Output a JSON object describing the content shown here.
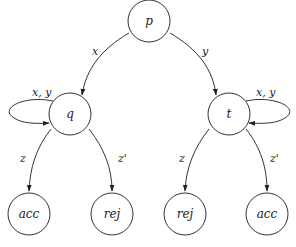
{
  "diagram": {
    "type": "state-transition",
    "nodes": {
      "p": {
        "label": "p"
      },
      "q": {
        "label": "q"
      },
      "t": {
        "label": "t"
      },
      "q_acc": {
        "label": "acc"
      },
      "q_rej": {
        "label": "rej"
      },
      "t_rej": {
        "label": "rej"
      },
      "t_acc": {
        "label": "acc"
      }
    },
    "edges": {
      "p_q": {
        "from": "p",
        "to": "q",
        "label": "x"
      },
      "p_t": {
        "from": "p",
        "to": "t",
        "label": "y"
      },
      "q_loop": {
        "from": "q",
        "to": "q",
        "label": "x, y"
      },
      "t_loop": {
        "from": "t",
        "to": "t",
        "label": "x, y"
      },
      "q_acc": {
        "from": "q",
        "to": "acc",
        "label": "z"
      },
      "q_rej": {
        "from": "q",
        "to": "rej",
        "label": "z'"
      },
      "t_rej": {
        "from": "t",
        "to": "rej",
        "label": "z"
      },
      "t_acc": {
        "from": "t",
        "to": "acc",
        "label": "z'"
      }
    }
  }
}
